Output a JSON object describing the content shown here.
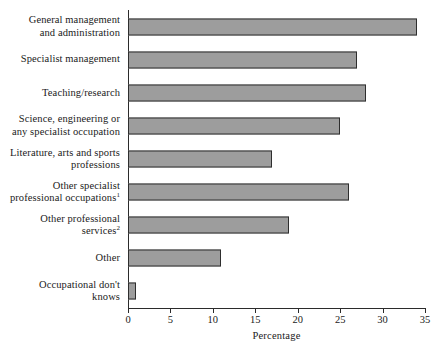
{
  "chart_data": {
    "type": "bar",
    "orientation": "horizontal",
    "title": "",
    "xlabel": "Percentage",
    "ylabel": "",
    "xlim": [
      0,
      35
    ],
    "xticks": [
      0,
      5,
      10,
      15,
      20,
      25,
      30,
      35
    ],
    "grid": false,
    "legend": null,
    "bar_color": "#9d9d9d",
    "bar_edge_color": "#2e2e2e",
    "categories": [
      "General management and administration",
      "Specialist management",
      "Teaching/research",
      "Science, engineering or any specialist occupation",
      "Literature, arts and sports professions",
      "Other specialist professional occupations",
      "Other professional services",
      "Other",
      "Occupational don't knows"
    ],
    "values": [
      34,
      27,
      28,
      25,
      17,
      26,
      19,
      11,
      1
    ]
  },
  "categories_display": [
    {
      "lines": [
        "General management",
        "and administration"
      ],
      "footnote": ""
    },
    {
      "lines": [
        "Specialist management"
      ],
      "footnote": ""
    },
    {
      "lines": [
        "Teaching/research"
      ],
      "footnote": ""
    },
    {
      "lines": [
        "Science, engineering or",
        "any specialist occupation"
      ],
      "footnote": ""
    },
    {
      "lines": [
        "Literature, arts and sports",
        "professions"
      ],
      "footnote": ""
    },
    {
      "lines": [
        "Other specialist",
        "professional occupations"
      ],
      "footnote": "1"
    },
    {
      "lines": [
        "Other professional",
        "services"
      ],
      "footnote": "2"
    },
    {
      "lines": [
        "Other"
      ],
      "footnote": ""
    },
    {
      "lines": [
        "Occupational don't",
        "knows"
      ],
      "footnote": ""
    }
  ],
  "axis": {
    "x_title": "Percentage",
    "x_tick_labels": [
      "0",
      "5",
      "10",
      "15",
      "20",
      "25",
      "30",
      "35"
    ]
  }
}
